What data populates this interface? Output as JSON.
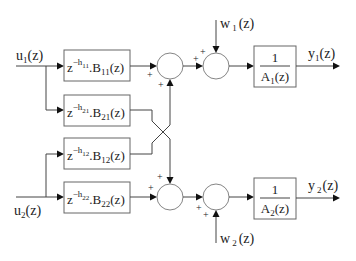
{
  "diagram": {
    "type": "block-diagram",
    "inputs": [
      {
        "id": "u1",
        "label_main": "u",
        "label_sub": "1",
        "label_suffix": "(z)"
      },
      {
        "id": "u2",
        "label_main": "u",
        "label_sub": "2",
        "label_suffix": "(z)"
      }
    ],
    "disturbances": [
      {
        "id": "w1",
        "label_main": "w",
        "label_sub": "1",
        "label_suffix": "(z)"
      },
      {
        "id": "w2",
        "label_main": "w",
        "label_sub": "2",
        "label_suffix": "(z)"
      }
    ],
    "outputs": [
      {
        "id": "y1",
        "label_main": "y",
        "label_sub": "1",
        "label_suffix": "(z)"
      },
      {
        "id": "y2",
        "label_main": "y",
        "label_sub": "2",
        "label_suffix": "(z)"
      }
    ],
    "transfer_blocks": [
      {
        "id": "B11",
        "z": "z",
        "exp_h": "−h",
        "exp_sub": "11",
        "mid": ".B",
        "b_sub": "11",
        "suffix": "(z)"
      },
      {
        "id": "B21",
        "z": "z",
        "exp_h": "−h",
        "exp_sub": "21",
        "mid": ".B",
        "b_sub": "21",
        "suffix": "(z)"
      },
      {
        "id": "B12",
        "z": "z",
        "exp_h": "−h",
        "exp_sub": "12",
        "mid": ".B",
        "b_sub": "12",
        "suffix": "(z)"
      },
      {
        "id": "B22",
        "z": "z",
        "exp_h": "−h",
        "exp_sub": "22",
        "mid": ".B",
        "b_sub": "22",
        "suffix": "(z)"
      }
    ],
    "denominator_blocks": [
      {
        "id": "A1",
        "numerator": "1",
        "den_main": "A",
        "den_sub": "1",
        "den_suffix": "(z)"
      },
      {
        "id": "A2",
        "numerator": "1",
        "den_main": "A",
        "den_sub": "2",
        "den_suffix": "(z)"
      }
    ],
    "summing_junctions": [
      {
        "id": "S1",
        "signs": [
          "+",
          "+"
        ]
      },
      {
        "id": "S2",
        "signs": [
          "+",
          "+"
        ]
      },
      {
        "id": "S3",
        "signs": [
          "+",
          "+"
        ]
      },
      {
        "id": "S4",
        "signs": [
          "+",
          "+"
        ]
      }
    ],
    "plus_sign": "+"
  }
}
